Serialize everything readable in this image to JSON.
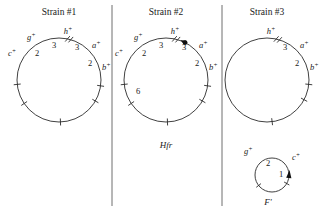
{
  "figure": {
    "background_color": "#ffffff",
    "line_color": "#2b2b2b",
    "width": 334,
    "height": 216
  },
  "panels": [
    {
      "id": "strain-1",
      "title": "Strain #1",
      "circle": {
        "cx": 59,
        "cy": 80,
        "r": 42
      },
      "genes": [
        {
          "name": "c+",
          "label": "c",
          "sup": "+",
          "angle": 186,
          "lx": 8,
          "ly": 56,
          "anchor": "start"
        },
        {
          "name": "g+",
          "label": "g",
          "sup": "+",
          "angle": 214,
          "lx": 27,
          "ly": 40,
          "anchor": "start"
        },
        {
          "name": "h+",
          "label": "h",
          "sup": "+",
          "angle": 272,
          "lx": 68,
          "ly": 34,
          "anchor": "middle"
        },
        {
          "name": "a+",
          "label": "a",
          "sup": "+",
          "angle": 330,
          "lx": 92,
          "ly": 48,
          "anchor": "start"
        },
        {
          "name": "b+",
          "label": "b",
          "sup": "+",
          "angle": 352,
          "lx": 102,
          "ly": 70,
          "anchor": "start"
        }
      ],
      "distances": [
        {
          "value": "2",
          "x": 37,
          "y": 56
        },
        {
          "value": "3",
          "x": 54,
          "y": 48
        },
        {
          "value": "3",
          "x": 77,
          "y": 50
        },
        {
          "value": "2",
          "x": 90,
          "y": 66
        }
      ],
      "break_mark": {
        "angle": 76
      },
      "origin": null,
      "caption": null
    },
    {
      "id": "strain-2",
      "title": "Strain #2",
      "circle": {
        "cx": 166,
        "cy": 80,
        "r": 42
      },
      "genes": [
        {
          "name": "c+",
          "label": "c",
          "sup": "+",
          "angle": 186,
          "lx": 115,
          "ly": 56,
          "anchor": "start"
        },
        {
          "name": "g+",
          "label": "g",
          "sup": "+",
          "angle": 214,
          "lx": 134,
          "ly": 40,
          "anchor": "start"
        },
        {
          "name": "h+",
          "label": "h",
          "sup": "+",
          "angle": 272,
          "lx": 175,
          "ly": 34,
          "anchor": "middle"
        },
        {
          "name": "a+",
          "label": "a",
          "sup": "+",
          "angle": 330,
          "lx": 199,
          "ly": 48,
          "anchor": "start"
        },
        {
          "name": "b+",
          "label": "b",
          "sup": "+",
          "angle": 352,
          "lx": 209,
          "ly": 70,
          "anchor": "start"
        }
      ],
      "distances": [
        {
          "value": "2",
          "x": 144,
          "y": 56
        },
        {
          "value": "3",
          "x": 161,
          "y": 48
        },
        {
          "value": "3",
          "x": 184,
          "y": 50
        },
        {
          "value": "2",
          "x": 197,
          "y": 66
        },
        {
          "value": "6",
          "x": 138,
          "y": 94
        }
      ],
      "break_mark": {
        "angle": 76
      },
      "origin": {
        "angle": 63,
        "arrow_angle": 63
      },
      "caption": {
        "text": "Hfr",
        "x": 166,
        "y": 148
      }
    },
    {
      "id": "strain-3",
      "title": "Strain #3",
      "circle": {
        "cx": 267,
        "cy": 80,
        "r": 42
      },
      "genes": [
        {
          "name": "h+",
          "label": "h",
          "sup": "+",
          "angle": 277,
          "lx": 271,
          "ly": 34,
          "anchor": "middle"
        },
        {
          "name": "a+",
          "label": "a",
          "sup": "+",
          "angle": 332,
          "lx": 300,
          "ly": 48,
          "anchor": "start"
        },
        {
          "name": "b+",
          "label": "b",
          "sup": "+",
          "angle": 354,
          "lx": 310,
          "ly": 70,
          "anchor": "start"
        }
      ],
      "distances": [
        {
          "value": "3",
          "x": 285,
          "y": 50
        },
        {
          "value": "2",
          "x": 297,
          "y": 66
        }
      ],
      "break_mark": {
        "angle": 75
      },
      "origin": null,
      "caption": null
    }
  ],
  "plasmid": {
    "id": "f-prime",
    "circle": {
      "cx": 272,
      "cy": 175,
      "r": 17
    },
    "genes": [
      {
        "name": "g+",
        "label": "g",
        "sup": "+",
        "angle": 218,
        "lx": 244,
        "ly": 154,
        "anchor": "start"
      },
      {
        "name": "c+",
        "label": "c",
        "sup": "+",
        "angle": 330,
        "lx": 292,
        "ly": 160,
        "anchor": "start"
      }
    ],
    "distances": [
      {
        "value": "2",
        "x": 268,
        "y": 166
      },
      {
        "value": "1",
        "x": 281,
        "y": 177
      }
    ],
    "arrow": {
      "angle": 355
    },
    "caption": {
      "text": "F'",
      "x": 268,
      "y": 205
    }
  },
  "dividers": [
    {
      "name": "divider-1",
      "x": 112,
      "y1": 5,
      "y2": 206
    },
    {
      "name": "divider-2",
      "x": 222,
      "y1": 5,
      "y2": 206
    }
  ],
  "titles": {
    "strain1_y": 15,
    "strain2_y": 15,
    "strain3_y": 15
  }
}
